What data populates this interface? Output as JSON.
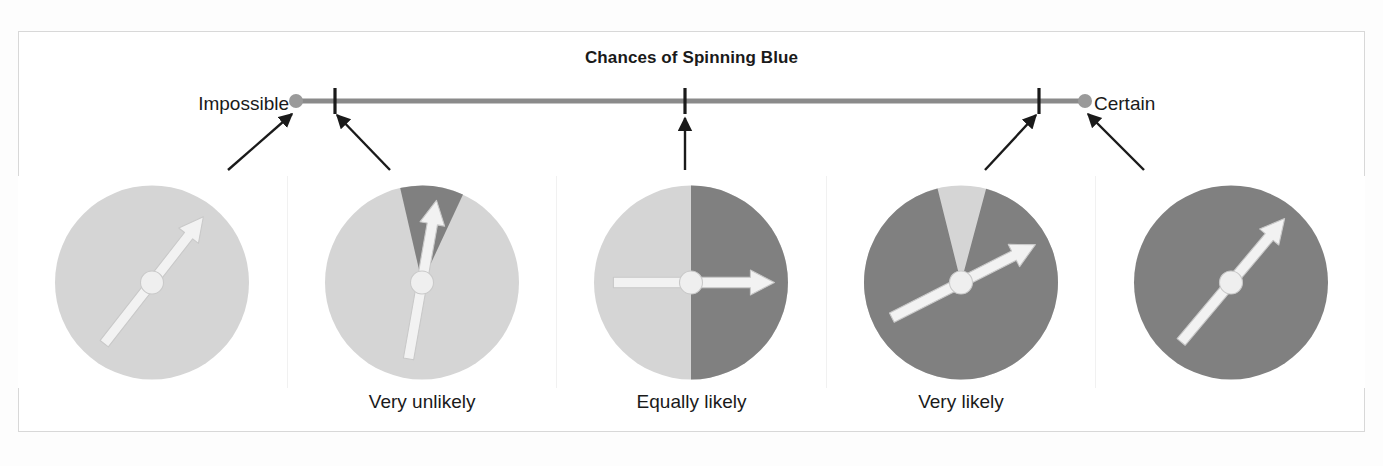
{
  "figure": {
    "title": "Chances of Spinning Blue",
    "frame_border_color": "#d8d8d8",
    "background_color": "#ffffff"
  },
  "number_line": {
    "left_end_label": "Impossible",
    "right_end_label": "Certain",
    "line_color": "#8a8a8a",
    "endpoint_dot_color": "#9a9a9a",
    "tick_color": "#1a1a1a",
    "arrow_color": "#1a1a1a",
    "endpoints": [
      {
        "name": "impossible",
        "x": 296,
        "probability": 0
      },
      {
        "name": "certain",
        "x": 1085,
        "probability": 1
      }
    ],
    "ticks": [
      {
        "name": "very-unlikely-tick",
        "x": 335,
        "label": "Very unlikely"
      },
      {
        "name": "equally-likely-tick",
        "x": 685,
        "label": "Equally likely"
      },
      {
        "name": "very-likely-tick",
        "x": 1039,
        "label": "Very likely"
      }
    ],
    "pointer_arrows": [
      {
        "name": "arrow-to-impossible",
        "x1": 228,
        "y1": 170,
        "x2": 292,
        "y2": 114
      },
      {
        "name": "arrow-to-very-unlikely",
        "x1": 390,
        "y1": 170,
        "x2": 337,
        "y2": 115
      },
      {
        "name": "arrow-to-equally-likely",
        "x1": 685,
        "y1": 170,
        "x2": 685,
        "y2": 118
      },
      {
        "name": "arrow-to-very-likely",
        "x1": 985,
        "y1": 170,
        "x2": 1036,
        "y2": 115
      },
      {
        "name": "arrow-to-certain",
        "x1": 1144,
        "y1": 170,
        "x2": 1088,
        "y2": 114
      }
    ]
  },
  "colors": {
    "blue_region": "#808080",
    "yellow_region": "#d5d5d5",
    "needle": "#f2f2f2",
    "needle_outline": "#c9c9c9",
    "hub": "#efefef"
  },
  "chart_data": {
    "type": "pie",
    "title": "Chances of Spinning Blue",
    "scale_min_label": "Impossible",
    "scale_max_label": "Certain",
    "categories": [
      "Impossible",
      "Very unlikely",
      "Equally likely",
      "Very likely",
      "Certain"
    ],
    "values": [
      0,
      0.1,
      0.5,
      0.92,
      1
    ],
    "series": [
      {
        "name": "blue fraction",
        "values": [
          0,
          0.1,
          0.5,
          0.92,
          1
        ]
      },
      {
        "name": "yellow fraction",
        "values": [
          1,
          0.9,
          0.5,
          0.08,
          0
        ]
      }
    ],
    "ylabel": "Probability of spinning blue",
    "xlabel": "",
    "ylim": [
      0,
      1
    ],
    "grid": false,
    "legend": "none"
  },
  "spinners": [
    {
      "name": "spinner-impossible",
      "label": "",
      "blue_fraction": 0,
      "blue_start_deg": 0,
      "blue_sweep_deg": 0,
      "needle_angle_deg": 52,
      "needle_double_ended": true
    },
    {
      "name": "spinner-very-unlikely",
      "label": "Very unlikely",
      "blue_fraction": 0.1,
      "blue_start_deg": 347,
      "blue_sweep_deg": 38,
      "needle_angle_deg": 80,
      "needle_double_ended": true
    },
    {
      "name": "spinner-equally-likely",
      "label": "Equally likely",
      "blue_fraction": 0.5,
      "blue_start_deg": 0,
      "blue_sweep_deg": 180,
      "needle_angle_deg": 0,
      "needle_double_ended": true
    },
    {
      "name": "spinner-very-likely",
      "label": "Very likely",
      "blue_fraction": 0.92,
      "blue_start_deg": 15,
      "blue_sweep_deg": 331,
      "needle_angle_deg": 27,
      "needle_double_ended": true
    },
    {
      "name": "spinner-certain",
      "label": "",
      "blue_fraction": 1,
      "blue_start_deg": 0,
      "blue_sweep_deg": 360,
      "needle_angle_deg": 50,
      "needle_double_ended": true
    }
  ],
  "bottom_labels": [
    "",
    "Very unlikely",
    "Equally likely",
    "Very likely",
    ""
  ]
}
